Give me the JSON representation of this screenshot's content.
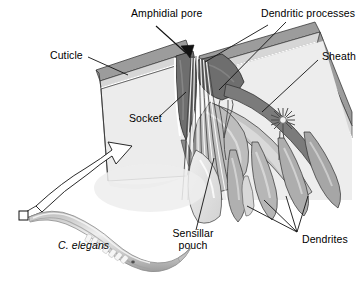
{
  "figure": {
    "background_color": "#ffffff",
    "width": 362,
    "height": 287
  },
  "labels": {
    "amphidial_pore": "Amphidial pore",
    "dendritic_processes": "Dendritic processes",
    "cuticle": "Cuticle",
    "sheath": "Sheath",
    "socket": "Socket",
    "sensillar_pouch_line1": "Sensillar",
    "sensillar_pouch_line2": "pouch",
    "dendrites": "Dendrites",
    "organism": "C. elegans"
  },
  "colors": {
    "outline": "#1a1a1a",
    "cuticle_outer": "#9a9a9a",
    "cuticle_inner": "#d9d9d9",
    "cuticle_pale": "#ededed",
    "socket_dark": "#6b6b6b",
    "sheath_mid": "#b5b5b5",
    "dendrite_gray": "#a8a8a8",
    "pouch_pale": "#e4e4e4",
    "worm_body": "#c9c9c9",
    "worm_highlight": "#efefef",
    "text": "#000000"
  }
}
